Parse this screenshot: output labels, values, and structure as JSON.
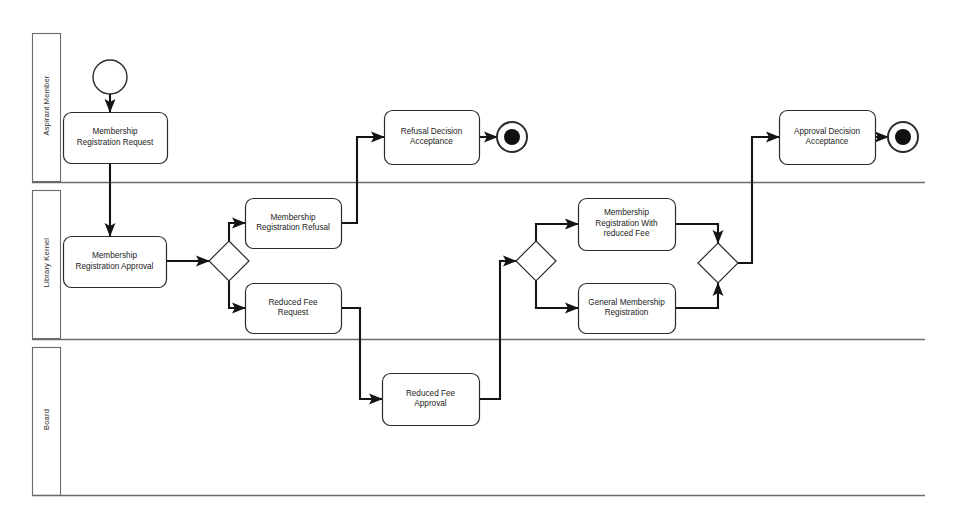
{
  "diagram": {
    "type": "bpmn-collaboration-diagram",
    "pool": {
      "x": 30,
      "y": 32,
      "width": 895,
      "height": 463
    },
    "colors": {
      "stroke": "#2b2b2b",
      "flow": "#141414",
      "fill": "#ffffff",
      "lane_border": "#6b6b6b"
    }
  },
  "lanes": [
    {
      "id": "lane-aspirant-member",
      "label": "Aspirant Member",
      "header": {
        "x": 32,
        "y": 33,
        "width": 28,
        "height": 148
      },
      "divider_y": 182
    },
    {
      "id": "lane-library-kernel",
      "label": "Library Kernel",
      "header": {
        "x": 32,
        "y": 190,
        "width": 28,
        "height": 148
      },
      "divider_y": 339
    },
    {
      "id": "lane-board",
      "label": "Board",
      "header": {
        "x": 32,
        "y": 347,
        "width": 28,
        "height": 148
      },
      "divider_y": 495
    }
  ],
  "events": [
    {
      "id": "start-event-membership-request",
      "kind": "start-event",
      "lane": "lane-aspirant-member",
      "cx": 110,
      "cy": 77,
      "r": 17
    },
    {
      "id": "end-event-refusal",
      "kind": "end-event",
      "lane": "lane-aspirant-member",
      "cx": 512,
      "cy": 137,
      "r": 15,
      "inner_r": 8
    },
    {
      "id": "end-event-approval",
      "kind": "end-event",
      "lane": "lane-aspirant-member",
      "cx": 903,
      "cy": 137,
      "r": 15,
      "inner_r": 8
    }
  ],
  "tasks": [
    {
      "id": "task-membership-registration-request",
      "label": "Membership\nRegistration Request",
      "lane": "lane-aspirant-member",
      "x": 63,
      "y": 112,
      "width": 104,
      "height": 51
    },
    {
      "id": "task-refusal-decision-acceptance",
      "label": "Refusal Decision\nAcceptance",
      "lane": "lane-aspirant-member",
      "x": 384,
      "y": 110,
      "width": 95,
      "height": 54
    },
    {
      "id": "task-approval-decision-acceptance",
      "label": "Approval Decision\nAcceptance",
      "lane": "lane-aspirant-member",
      "x": 779,
      "y": 110,
      "width": 96,
      "height": 54
    },
    {
      "id": "task-membership-registration-approval",
      "label": "Membership\nRegistration Approval",
      "lane": "lane-library-kernel",
      "x": 63,
      "y": 236,
      "width": 103,
      "height": 51
    },
    {
      "id": "task-membership-registration-refusal",
      "label": "Membership\nRegistration Refusal",
      "lane": "lane-library-kernel",
      "x": 245,
      "y": 198,
      "width": 96,
      "height": 50
    },
    {
      "id": "task-reduced-fee-request",
      "label": "Reduced Fee\nRequest",
      "lane": "lane-library-kernel",
      "x": 245,
      "y": 283,
      "width": 96,
      "height": 50
    },
    {
      "id": "task-membership-registration-with-reduced-fee",
      "label": "Membership\nRegistration With\nreduced Fee",
      "lane": "lane-library-kernel",
      "x": 578,
      "y": 198,
      "width": 97,
      "height": 52
    },
    {
      "id": "task-general-membership-registration",
      "label": "General Membership\nRegistration",
      "lane": "lane-library-kernel",
      "x": 578,
      "y": 283,
      "width": 97,
      "height": 50
    },
    {
      "id": "task-reduced-fee-approval",
      "label": "Reduced Fee\nApproval",
      "lane": "lane-board",
      "x": 382,
      "y": 373,
      "width": 97,
      "height": 52
    }
  ],
  "gateways": [
    {
      "id": "gateway-approval-split",
      "lane": "lane-library-kernel",
      "cx": 229,
      "cy": 261,
      "half": 20
    },
    {
      "id": "gateway-fee-split",
      "lane": "lane-library-kernel",
      "cx": 536,
      "cy": 261,
      "half": 20
    },
    {
      "id": "gateway-registration-merge",
      "lane": "lane-library-kernel",
      "cx": 718,
      "cy": 263,
      "half": 20
    }
  ],
  "flows": [
    {
      "id": "flow-start-to-request",
      "from": "start-event-membership-request",
      "to": "task-membership-registration-request",
      "points": "110,94 110,112"
    },
    {
      "id": "flow-request-to-approval",
      "from": "task-membership-registration-request",
      "to": "task-membership-registration-approval",
      "points": "110,163 110,236"
    },
    {
      "id": "flow-approval-to-gateway",
      "from": "task-membership-registration-approval",
      "to": "gateway-approval-split",
      "points": "166,261 209,261"
    },
    {
      "id": "flow-gateway-to-refusal",
      "from": "gateway-approval-split",
      "to": "task-membership-registration-refusal",
      "points": "229,241 229,223 245,223"
    },
    {
      "id": "flow-gateway-to-reduced-fee-request",
      "from": "gateway-approval-split",
      "to": "task-reduced-fee-request",
      "points": "229,281 229,308 245,308"
    },
    {
      "id": "flow-refusal-to-refusal-acceptance",
      "from": "task-membership-registration-refusal",
      "to": "task-refusal-decision-acceptance",
      "points": "341,223 357,223 357,137 384,137"
    },
    {
      "id": "flow-refusal-acceptance-to-end",
      "from": "task-refusal-decision-acceptance",
      "to": "end-event-refusal",
      "points": "479,137 497,137"
    },
    {
      "id": "flow-reduced-fee-request-to-approval",
      "from": "task-reduced-fee-request",
      "to": "task-reduced-fee-approval",
      "points": "341,308 360,308 360,399 382,399"
    },
    {
      "id": "flow-reduced-fee-approval-to-gateway",
      "from": "task-reduced-fee-approval",
      "to": "gateway-fee-split",
      "points": "479,399 500,399 500,261 516,261"
    },
    {
      "id": "flow-gateway-to-reduced-fee-registration",
      "from": "gateway-fee-split",
      "to": "task-membership-registration-with-reduced-fee",
      "points": "536,241 536,224 578,224"
    },
    {
      "id": "flow-gateway-to-general-registration",
      "from": "gateway-fee-split",
      "to": "task-general-membership-registration",
      "points": "536,281 536,308 578,308"
    },
    {
      "id": "flow-reduced-fee-registration-to-merge",
      "from": "task-membership-registration-with-reduced-fee",
      "to": "gateway-registration-merge",
      "points": "675,224 718,224 718,243"
    },
    {
      "id": "flow-general-registration-to-merge",
      "from": "task-general-membership-registration",
      "to": "gateway-registration-merge",
      "points": "675,308 718,308 718,283"
    },
    {
      "id": "flow-merge-to-approval-acceptance",
      "from": "gateway-registration-merge",
      "to": "task-approval-decision-acceptance",
      "points": "738,263 752,263 752,137 779,137"
    },
    {
      "id": "flow-approval-acceptance-to-end",
      "from": "task-approval-decision-acceptance",
      "to": "end-event-approval",
      "points": "875,137 888,137"
    }
  ]
}
